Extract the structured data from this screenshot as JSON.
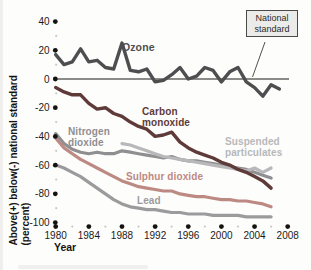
{
  "figure": {
    "y_axis_title_line1": "Above(+) below(-) national standard",
    "y_axis_title_line2": "(percent)",
    "x_axis_title": "Year",
    "callout_text": "National standard"
  },
  "chart_data": {
    "type": "line",
    "title": "",
    "xlabel": "Year",
    "ylabel": "Above(+) below(-) national standard (percent)",
    "xlim": [
      1980,
      2008
    ],
    "ylim": [
      -100,
      40
    ],
    "grid": false,
    "legend_position": "inline-labels",
    "x_ticks": [
      1980,
      1984,
      1988,
      1992,
      1996,
      2000,
      2004,
      2008
    ],
    "x_tick_labels": [
      "1980",
      "1984",
      "1988",
      "1992",
      "1996",
      "2000",
      "2004",
      "2008"
    ],
    "y_ticks": [
      40,
      20,
      0,
      -20,
      -40,
      -60,
      -80,
      -100
    ],
    "y_tick_labels": [
      "40",
      "20",
      "0",
      "-20",
      "-40",
      "-60",
      "-80",
      "-100"
    ],
    "tick_dot_color": "#151310",
    "minor_dot_color": "#c9c8c6",
    "standard_line": {
      "label": "National standard",
      "y": 0,
      "color": "#1d1b19"
    },
    "series": [
      {
        "id": "nitrogen-dioxide",
        "name": "Nitrogen dioxide",
        "color": "#8f8f92",
        "width": 3.2,
        "start_year": 1980,
        "values": [
          -38,
          -45,
          -49,
          -51,
          -52,
          -51,
          -52,
          -52,
          -50,
          -51,
          -52,
          -53,
          -54,
          -55,
          -54,
          -56,
          -57,
          -57,
          -58,
          -59,
          -60,
          -61,
          -62,
          -63,
          -65,
          -67,
          -69
        ]
      },
      {
        "id": "sulphur-dioxide",
        "name": "Sulphur dioxide",
        "color": "#bd8a83",
        "width": 3.2,
        "start_year": 1980,
        "values": [
          -41,
          -48,
          -52,
          -56,
          -59,
          -62,
          -65,
          -68,
          -71,
          -73,
          -75,
          -76,
          -77,
          -78,
          -78,
          -80,
          -81,
          -82,
          -82,
          -83,
          -84,
          -84,
          -85,
          -85,
          -86,
          -87,
          -89
        ]
      },
      {
        "id": "lead",
        "name": "Lead",
        "color": "#9b9b9d",
        "width": 3.2,
        "start_year": 1980,
        "values": [
          -60,
          -62,
          -65,
          -68,
          -72,
          -76,
          -80,
          -84,
          -87,
          -89,
          -90,
          -91,
          -91,
          -92,
          -93,
          -93,
          -94,
          -94,
          -94,
          -95,
          -95,
          -95,
          -95,
          -96,
          -96,
          -96,
          -96
        ]
      },
      {
        "id": "suspended-particulates",
        "name": "Suspended particulates",
        "color": "#b8b8ba",
        "width": 3.2,
        "start_year": 1988,
        "values": [
          -45,
          -46,
          -48,
          -50,
          -52,
          -54,
          -55,
          -56,
          -57,
          -58,
          -59,
          -60,
          -61,
          -62,
          -63,
          -64,
          -62,
          -65,
          -62
        ]
      },
      {
        "id": "carbon-monoxide",
        "name": "Carbon monoxide",
        "color": "#5e3a39",
        "width": 3.4,
        "start_year": 1980,
        "values": [
          -6,
          -9,
          -11,
          -11,
          -17,
          -21,
          -20,
          -24,
          -26,
          -30,
          -33,
          -35,
          -40,
          -39,
          -37,
          -44,
          -48,
          -51,
          -53,
          -55,
          -58,
          -60,
          -63,
          -65,
          -68,
          -71,
          -76
        ]
      },
      {
        "id": "ozone",
        "name": "Ozone",
        "color": "#4e4e50",
        "width": 3.4,
        "start_year": 1980,
        "values": [
          17,
          10,
          12,
          21,
          12,
          13,
          8,
          7,
          25,
          6,
          5,
          7,
          -2,
          -1,
          3,
          8,
          0,
          2,
          8,
          6,
          -2,
          5,
          8,
          -2,
          -6,
          -12,
          -4,
          -7
        ]
      }
    ]
  }
}
